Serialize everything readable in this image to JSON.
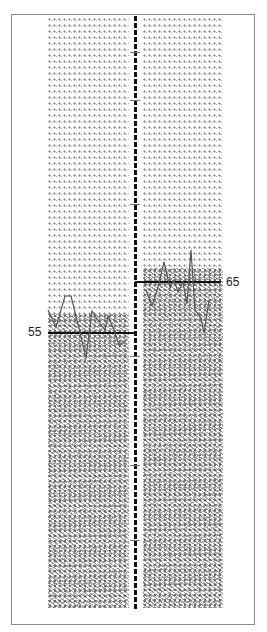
{
  "figure": {
    "colors": {
      "border": "#8a8a8a",
      "divider": "#111111",
      "threshold": "#111111",
      "trace": "#555555",
      "glyph": "#8c8c8c"
    },
    "left_panel": {
      "threshold_label": "55",
      "threshold_y": 333,
      "trace_points": [
        [
          48,
          310
        ],
        [
          56,
          327
        ],
        [
          65,
          296
        ],
        [
          71,
          296
        ],
        [
          79,
          328
        ],
        [
          86,
          358
        ],
        [
          92,
          311
        ],
        [
          99,
          322
        ],
        [
          105,
          330
        ],
        [
          108,
          316
        ],
        [
          114,
          330
        ],
        [
          119,
          345
        ],
        [
          124,
          342
        ]
      ]
    },
    "right_panel": {
      "threshold_label": "65",
      "threshold_y": 282,
      "trace_points": [
        [
          146,
          290
        ],
        [
          152,
          306
        ],
        [
          158,
          287
        ],
        [
          164,
          262
        ],
        [
          170,
          288
        ],
        [
          174,
          280
        ],
        [
          178,
          292
        ],
        [
          183,
          282
        ],
        [
          187,
          304
        ],
        [
          191,
          250
        ],
        [
          195,
          310
        ],
        [
          201,
          318
        ],
        [
          204,
          333
        ],
        [
          209,
          300
        ]
      ]
    }
  }
}
